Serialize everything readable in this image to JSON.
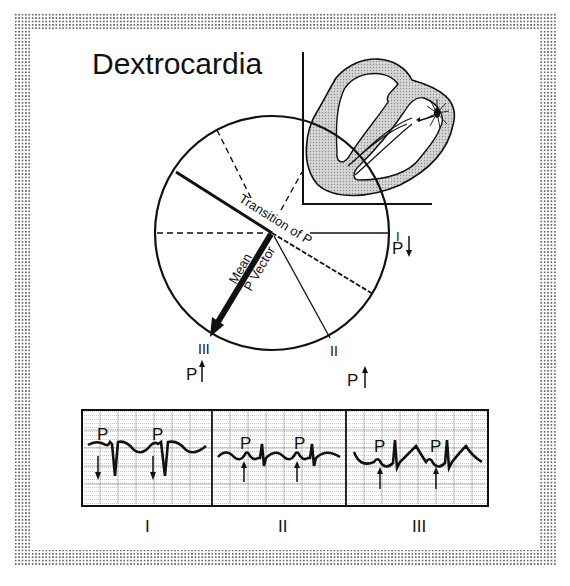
{
  "title": "Dextrocardia",
  "hexaxial": {
    "transition_label": "Transition of P",
    "vector_label_line1": "Mean",
    "vector_label_line2": "P Vector",
    "leads": [
      {
        "name": "I",
        "p_direction": "down",
        "p_label": "P"
      },
      {
        "name": "II",
        "p_direction": "up",
        "p_label": "P"
      },
      {
        "name": "III",
        "p_direction": "up",
        "p_label": "P"
      }
    ]
  },
  "heart_inset": {
    "description": "Heart cross-section with pacemaker origin on the left side (mirror image)"
  },
  "ecg_strips": [
    {
      "lead": "I",
      "p_label": "P",
      "p_wave": "inverted",
      "arrow": "down"
    },
    {
      "lead": "II",
      "p_label": "P",
      "p_wave": "upright",
      "arrow": "up"
    },
    {
      "lead": "III",
      "p_label": "P",
      "p_wave": "upright",
      "arrow": "up"
    }
  ],
  "colors": {
    "ink": "#111111",
    "paper": "#ffffff",
    "heart_wall": "#bdbdbd",
    "grid": "#9a9a9a"
  }
}
